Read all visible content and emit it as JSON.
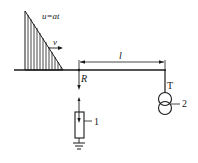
{
  "diagram": {
    "wave_label": "u=at",
    "velocity_label": "v",
    "distance_label": "l",
    "point_label": "R",
    "arrester_label": "1",
    "transformer_tag": "T",
    "transformer_label": "2",
    "colors": {
      "stroke": "#1a1a1a",
      "background": "#ffffff"
    }
  }
}
